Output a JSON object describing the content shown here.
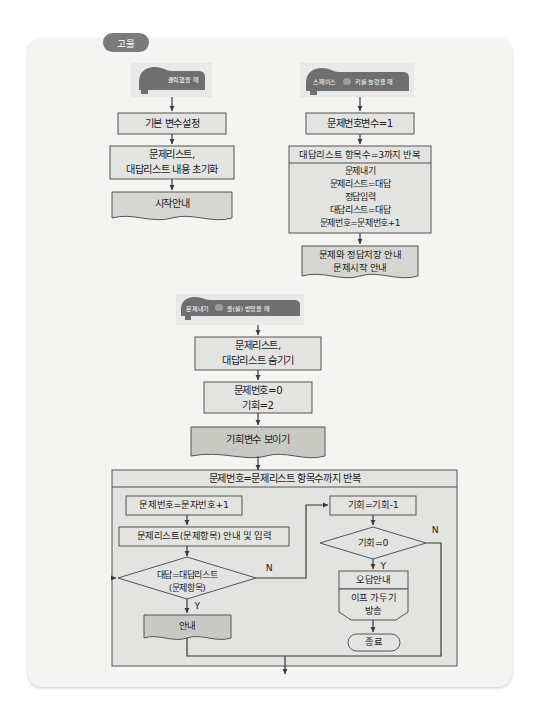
{
  "meta": {
    "title": "고울",
    "bg_color": "#f4f4f2",
    "box_fill": "#e3e3e1",
    "accent_fill": "#c9c9c4",
    "hat_fill": "#6f6f6f",
    "stroke": "#555555"
  },
  "tag": {
    "label": "고울"
  },
  "hats": [
    {
      "name": "when-clicked",
      "text": "클릭했을 때",
      "dropdown": false
    },
    {
      "name": "when-space-key-pressed",
      "text_before": "스페이스",
      "dropdown": true,
      "text_after": "키를 눌렀을 때"
    },
    {
      "name": "when-receive-message",
      "text_before": "문제내기",
      "dropdown": true,
      "text_after": "을(를) 받았을 때"
    }
  ],
  "columns": {
    "left": {
      "nodes": [
        {
          "id": "l1",
          "shape": "rect",
          "lines": [
            "기본 변수설정"
          ]
        },
        {
          "id": "l2",
          "shape": "rect",
          "lines": [
            "문제리스트,",
            "대답리스트 내용 초기화"
          ]
        },
        {
          "id": "l3",
          "shape": "document",
          "lines": [
            "시작안내"
          ]
        }
      ]
    },
    "right": {
      "nodes": [
        {
          "id": "r1",
          "shape": "rect",
          "lines": [
            "문제번호변수=1"
          ]
        },
        {
          "id": "r2",
          "shape": "loop",
          "header": "대답리스트 항목수=3까지 반복",
          "lines": [
            "문제내기",
            "문제리스트=대답",
            "정답입력",
            "대답리스트=대답",
            "문제번호=문제번호+1"
          ]
        },
        {
          "id": "r3",
          "shape": "document",
          "lines": [
            "문제와 정답저장 안내",
            "문제시작 안내"
          ]
        }
      ]
    },
    "middle": {
      "nodes": [
        {
          "id": "m1",
          "shape": "rect",
          "lines": [
            "문제리스트,",
            "대답리스트 숨기기"
          ]
        },
        {
          "id": "m2",
          "shape": "rect",
          "lines": [
            "문제번호=0",
            "기회=2"
          ]
        },
        {
          "id": "m3",
          "shape": "process",
          "lines": [
            "기회변수 보이기"
          ]
        }
      ]
    }
  },
  "main_loop": {
    "header": "문제번호=문제리스트 항목수까지 반복",
    "left_branch": [
      {
        "id": "b1",
        "shape": "rect",
        "lines": [
          "문제번호=문자번호+1"
        ]
      },
      {
        "id": "b2",
        "shape": "rect",
        "lines": [
          "문제리스트(문제항목) 안내 및 입력"
        ]
      },
      {
        "id": "b3",
        "shape": "diamond",
        "lines": [
          "대답=대답리스트",
          "(문제항목)"
        ],
        "yes": "Y",
        "no": "N"
      },
      {
        "id": "b4",
        "shape": "document",
        "lines": [
          "안내"
        ]
      }
    ],
    "right_branch": [
      {
        "id": "c1",
        "shape": "rect",
        "lines": [
          "기회=기회-1"
        ]
      },
      {
        "id": "c2",
        "shape": "diamond",
        "lines": [
          "기회=0"
        ],
        "yes": "Y",
        "no": "N"
      },
      {
        "id": "c3",
        "shape": "rect",
        "lines": [
          "오답안내"
        ]
      },
      {
        "id": "c4",
        "shape": "pentagon",
        "lines": [
          "이프 가두기",
          "방송"
        ]
      },
      {
        "id": "c5",
        "shape": "terminal",
        "lines": [
          "종료"
        ]
      }
    ]
  }
}
